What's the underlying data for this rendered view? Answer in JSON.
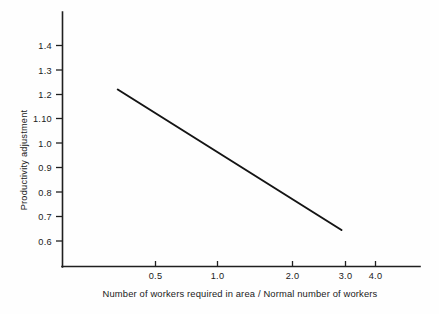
{
  "chart_data": {
    "type": "line",
    "title": "",
    "subtitle": "",
    "xlabel": "Number of workers required in area / Normal number of workers",
    "ylabel": "Productivity adjustment",
    "x_scale": "log",
    "y_scale": "linear",
    "grid": false,
    "legend": null,
    "xlim": [
      0.28,
      4.6
    ],
    "ylim": [
      0.55,
      1.47
    ],
    "xticks": [
      0.5,
      1.0,
      2.0,
      3.0,
      4.0
    ],
    "xtick_labels": [
      "0.5",
      "1.0",
      "2.0",
      "3.0",
      "4.0"
    ],
    "yticks": [
      0.6,
      0.7,
      0.8,
      0.9,
      1.0,
      1.1,
      1.2,
      1.3,
      1.4
    ],
    "ytick_labels": [
      "0.6",
      "0.7",
      "0.8",
      "0.9",
      "1.0",
      "1.10",
      "1.2",
      "1.3",
      "1.4"
    ],
    "series": [
      {
        "name": "Productivity adjustment",
        "x": [
          0.35,
          2.9
        ],
        "values": [
          1.22,
          0.645
        ],
        "color": "#141414"
      }
    ]
  },
  "axes": {
    "x_title": "Number of workers required in area / Normal number of workers",
    "y_title": "Productivity adjustment"
  }
}
